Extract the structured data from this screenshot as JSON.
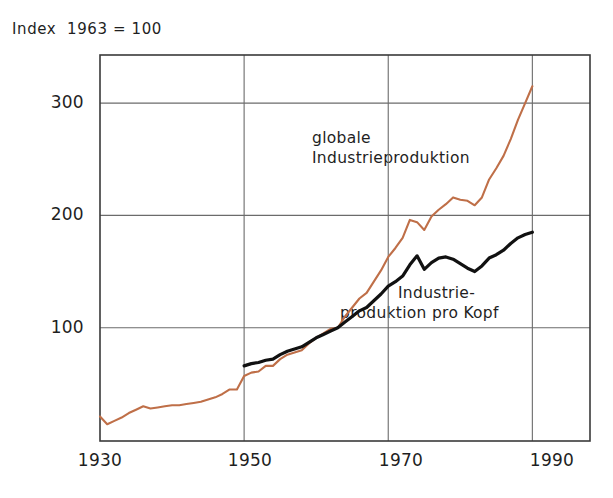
{
  "chart_data": {
    "type": "line",
    "title": "",
    "subtitle": "",
    "axis_note": "Index  1963 = 100",
    "xlabel": "",
    "ylabel": "",
    "xlim": [
      1930,
      1998
    ],
    "ylim": [
      0,
      345
    ],
    "xticks": [
      1930,
      1950,
      1970,
      1990
    ],
    "xtick_labels": [
      "1930",
      "1950",
      "1970",
      "1990"
    ],
    "yticks": [
      100,
      200,
      300
    ],
    "ytick_labels": [
      "100",
      "200",
      "300"
    ],
    "grid": true,
    "legend_position": "inline-annotations",
    "series": [
      {
        "name": "globale Industrieproduktion",
        "label_lines": [
          "globale",
          "Industrieproduktion"
        ],
        "color": "#bf6f48",
        "x": [
          1930,
          1931,
          1932,
          1933,
          1934,
          1935,
          1936,
          1937,
          1938,
          1939,
          1940,
          1941,
          1942,
          1943,
          1944,
          1945,
          1946,
          1947,
          1948,
          1949,
          1950,
          1951,
          1952,
          1953,
          1954,
          1955,
          1956,
          1957,
          1958,
          1959,
          1960,
          1961,
          1962,
          1963,
          1964,
          1965,
          1966,
          1967,
          1968,
          1969,
          1970,
          1971,
          1972,
          1973,
          1974,
          1975,
          1976,
          1977,
          1978,
          1979,
          1980,
          1981,
          1982,
          1983,
          1984,
          1985,
          1986,
          1987,
          1988,
          1989,
          1990
        ],
        "y": [
          21,
          14,
          17,
          20,
          24,
          27,
          30,
          28,
          29,
          30,
          31,
          31,
          32,
          33,
          34,
          36,
          38,
          41,
          45,
          45,
          57,
          60,
          61,
          66,
          66,
          72,
          76,
          78,
          80,
          86,
          91,
          95,
          99,
          100,
          110,
          118,
          126,
          131,
          141,
          151,
          163,
          171,
          180,
          196,
          194,
          187,
          199,
          205,
          210,
          216,
          214,
          213,
          209,
          216,
          232,
          242,
          253,
          268,
          285,
          300,
          315
        ],
        "value_1930": 21,
        "value_1963": 100,
        "value_1990": 315
      },
      {
        "name": "Industrieproduktion pro Kopf",
        "label_lines": [
          "Industrie-",
          "produktion pro Kopf"
        ],
        "color": "#111111",
        "x": [
          1950,
          1951,
          1952,
          1953,
          1954,
          1955,
          1956,
          1957,
          1958,
          1959,
          1960,
          1961,
          1962,
          1963,
          1964,
          1965,
          1966,
          1967,
          1968,
          1969,
          1970,
          1971,
          1972,
          1973,
          1974,
          1975,
          1976,
          1977,
          1978,
          1979,
          1980,
          1981,
          1982,
          1983,
          1984,
          1985,
          1986,
          1987,
          1988,
          1989,
          1990
        ],
        "y": [
          66,
          68,
          69,
          71,
          72,
          76,
          79,
          81,
          83,
          87,
          91,
          94,
          97,
          100,
          105,
          110,
          115,
          118,
          124,
          130,
          137,
          141,
          146,
          156,
          164,
          152,
          158,
          162,
          163,
          161,
          157,
          153,
          150,
          155,
          162,
          165,
          169,
          175,
          180,
          183,
          185
        ],
        "value_1950": 66,
        "value_1963": 100,
        "value_1990": 185
      }
    ]
  },
  "geometry": {
    "plot_left": 100,
    "plot_right": 590,
    "plot_top": 55,
    "plot_bottom": 441,
    "x_per_year": 7.55,
    "y_per_unit": 1.123,
    "y_zero_px": 440
  },
  "annotations": {
    "series1": {
      "x": 312,
      "y": 128
    },
    "series2": {
      "x": 410,
      "y": 283
    }
  },
  "colors": {
    "global_line": "#bf6f48",
    "per_capita_line": "#111111",
    "axis": "#3a3a3a",
    "grid": "#6b6b6b",
    "background": "#ffffff",
    "text": "#1f1f1f"
  }
}
